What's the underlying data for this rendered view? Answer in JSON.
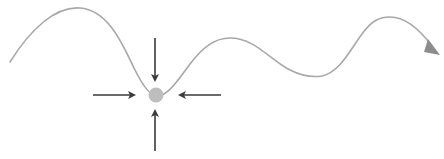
{
  "diagram": {
    "colors": {
      "background": "#ffffff",
      "curve": "#a8a8a8",
      "ball": "#bdbdbd",
      "arrows": "#3a3a3a",
      "curve_arrowhead": "#8c8c8c"
    },
    "curve": {
      "path": "M10,62 C30,30 55,6 80,8 C110,10 125,50 135,70 C143,86 150,96 157,96 C168,96 178,80 190,64 C203,47 215,38 230,38 C255,38 270,60 290,70 C300,75 310,78 322,76 C340,72 350,50 362,34 C372,20 380,17 390,17 C405,17 420,30 432,46",
      "arrowhead_points": "428,39 440,55 424,52"
    },
    "ball": {
      "cx": 156,
      "cy": 95,
      "r": 7.5
    },
    "arrows": [
      {
        "name": "arrow-from-top",
        "x1": 155,
        "y1": 38,
        "x2": 155,
        "y2": 80
      },
      {
        "name": "arrow-from-bottom",
        "x1": 155,
        "y1": 151,
        "x2": 155,
        "y2": 111
      },
      {
        "name": "arrow-from-left",
        "x1": 93,
        "y1": 95,
        "x2": 134,
        "y2": 95
      },
      {
        "name": "arrow-from-right",
        "x1": 221,
        "y1": 95,
        "x2": 180,
        "y2": 95
      }
    ]
  }
}
